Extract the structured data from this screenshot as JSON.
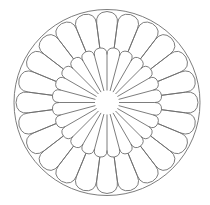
{
  "figure": {
    "title": "Chrysanthemum petal line drawing",
    "canvas": {
      "width": 210,
      "height": 205,
      "background": "#ffffff"
    },
    "stroke_color": "#6e6e6e",
    "stroke_width": 0.9,
    "center": {
      "x": 107,
      "y": 102.5
    },
    "outer_circle_radius": 93,
    "center_hole_radius": 12,
    "petal_count": 24,
    "start_angle_deg": 0,
    "outer_ring": {
      "petal_base_radius": 55,
      "petal_tip_radius": 91,
      "tip_roundness": 0.9
    },
    "inner_ring": {
      "petal_tip_radius": 55,
      "tip_roundness": 0.9
    }
  }
}
